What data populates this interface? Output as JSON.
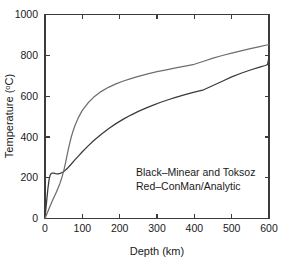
{
  "chart_data": {
    "type": "line",
    "title": "",
    "xlabel": "Depth (km)",
    "ylabel": "Temperature (°C)",
    "ylabel_base": "Temperature (",
    "ylabel_sup": "o",
    "ylabel_tail": "C)",
    "xlim": [
      0,
      600
    ],
    "ylim": [
      0,
      1000
    ],
    "grid": false,
    "legend_position": "inside-lower-right",
    "xticks": [
      0,
      100,
      200,
      300,
      400,
      500,
      600
    ],
    "xtick_labels": [
      "0",
      "100",
      "200",
      "300",
      "400",
      "500",
      "600"
    ],
    "yticks": [
      0,
      200,
      400,
      600,
      800,
      1000
    ],
    "ytick_labels": [
      "0",
      "200",
      "400",
      "600",
      "800",
      "1000"
    ],
    "annotations": [
      "Black–Minear and Toksoz",
      "Red–ConMan/Analytic"
    ],
    "series": [
      {
        "name": "Minear and Toksoz",
        "color": "#3a3a3a",
        "legend_label": "Black–Minear and Toksoz",
        "x": [
          0,
          2,
          5,
          8,
          11,
          14,
          17,
          20,
          24,
          28,
          32,
          36,
          40,
          44,
          48,
          52,
          56,
          60,
          65,
          70,
          80,
          90,
          100,
          115,
          130,
          150,
          170,
          190,
          210,
          230,
          250,
          270,
          290,
          310,
          330,
          350,
          375,
          400,
          425,
          450,
          475,
          500,
          525,
          550,
          575,
          590,
          596,
          598,
          600
        ],
        "y": [
          0,
          40,
          96,
          150,
          192,
          214,
          221,
          223,
          222,
          220,
          219,
          219,
          221,
          224,
          228,
          233,
          239,
          246,
          256,
          266,
          287,
          307,
          327,
          355,
          381,
          412,
          440,
          465,
          487,
          507,
          525,
          541,
          556,
          570,
          582,
          594,
          607,
          619,
          631,
          652,
          673,
          694,
          712,
          728,
          742,
          750,
          754,
          772,
          793
        ]
      },
      {
        "name": "ConMan/Analytic",
        "color": "#6e6e6e",
        "legend_label": "Red–ConMan/Analytic",
        "x": [
          0,
          4,
          8,
          12,
          16,
          20,
          25,
          30,
          35,
          40,
          45,
          50,
          55,
          60,
          65,
          70,
          75,
          80,
          90,
          100,
          115,
          130,
          150,
          170,
          190,
          210,
          230,
          250,
          275,
          300,
          325,
          350,
          375,
          400,
          425,
          450,
          475,
          500,
          525,
          550,
          575,
          600
        ],
        "y": [
          0,
          18,
          36,
          54,
          71,
          88,
          108,
          128,
          149,
          172,
          200,
          232,
          273,
          318,
          360,
          397,
          428,
          455,
          497,
          530,
          566,
          594,
          622,
          643,
          660,
          674,
          686,
          697,
          709,
          720,
          729,
          738,
          747,
          756,
          771,
          786,
          799,
          811,
          822,
          833,
          843,
          853
        ]
      }
    ]
  },
  "figure": {
    "background": "#ffffff",
    "axis_color": "#3c3c3c",
    "text_color": "#1a1a1a"
  }
}
